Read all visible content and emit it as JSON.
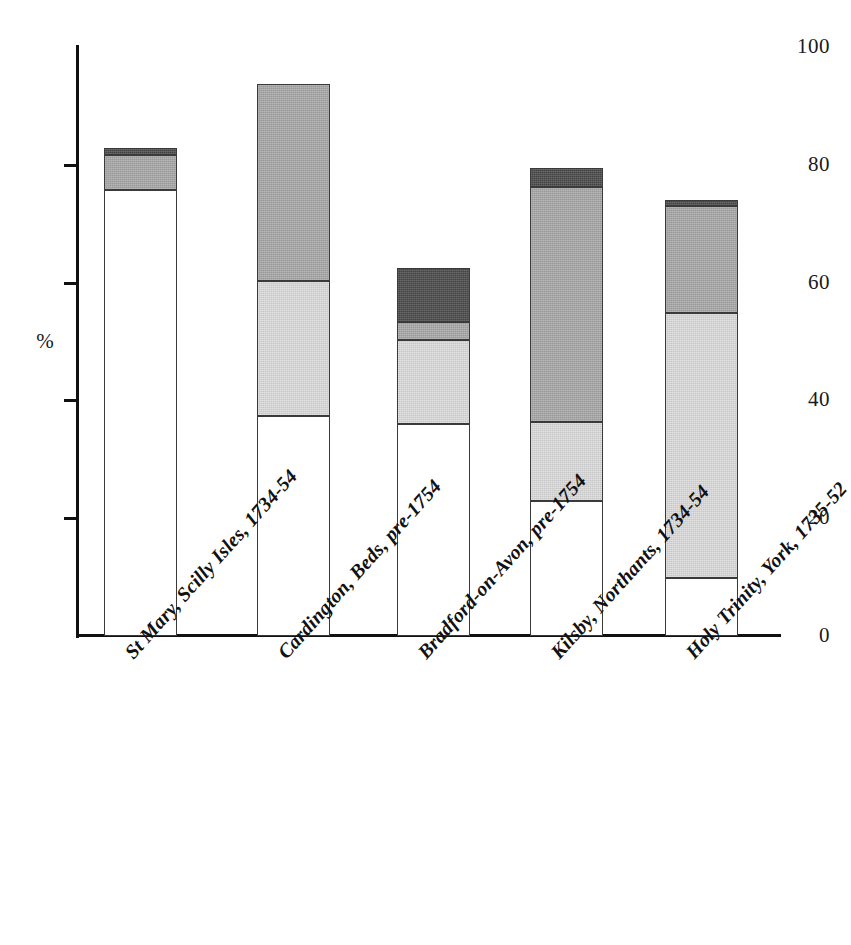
{
  "chart_data": {
    "type": "bar",
    "subtype": "stacked-bar",
    "title": "",
    "xlabel": "",
    "ylabel": "%",
    "ylim": [
      0,
      100
    ],
    "grid": false,
    "legend": "none",
    "y_ticks": [
      0,
      20,
      40,
      60,
      80,
      100
    ],
    "y_tick_labels": [
      "0",
      "20",
      "40",
      "60",
      "80",
      "100"
    ],
    "categories": [
      "St Mary, Scilly Isles, 1734-54",
      "Cardington, Beds, pre-1754",
      "Bradford-on-Avon, pre-1754",
      "Kilsby, Northants, 1734-54",
      "Holy Trinity, York, 1735-52"
    ],
    "series": [
      {
        "name": "white-segment",
        "fill": "white",
        "color": "#ffffff",
        "values": [
          75.7,
          37.4,
          36.0,
          22.9,
          9.8
        ]
      },
      {
        "name": "light-segment",
        "fill": "light",
        "color": "#dcdcdc",
        "values": [
          0.0,
          22.9,
          14.3,
          13.4,
          45.0
        ]
      },
      {
        "name": "medium-segment",
        "fill": "medium",
        "color": "#a8a8a8",
        "values": [
          5.9,
          33.4,
          3.0,
          39.9,
          18.2
        ]
      },
      {
        "name": "dark-segment",
        "fill": "dark",
        "color": "#4a4a4a",
        "values": [
          1.2,
          0.0,
          9.2,
          3.3,
          1.0
        ]
      }
    ],
    "totals": [
      82.8,
      93.7,
      62.5,
      79.5,
      74.0
    ]
  },
  "colors": {
    "axis": "#111111",
    "outline": "#3a3a3a",
    "white": "#ffffff",
    "light": "#dcdcdc",
    "medium": "#a8a8a8",
    "dark": "#4a4a4a",
    "text": "#1a1a1a",
    "background": "#ffffff"
  }
}
